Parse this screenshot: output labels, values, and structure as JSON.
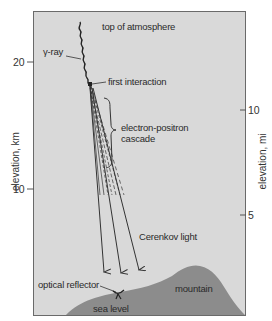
{
  "diagram": {
    "labels": {
      "top_of_atmosphere": "top of atmosphere",
      "gamma_ray": "γ-ray",
      "first_interaction": "first interaction",
      "cascade_line1": "electron-positron",
      "cascade_line2": "cascade",
      "cerenkov_light": "Cerenkov light",
      "optical_reflector": "optical reflector",
      "mountain": "mountain",
      "sea_level": "sea level"
    },
    "left_axis": {
      "title": "elevation, km",
      "ticks": [
        {
          "value": "20",
          "y": 62
        },
        {
          "value": "10",
          "y": 189
        }
      ]
    },
    "right_axis": {
      "title": "elevation, mi",
      "ticks": [
        {
          "value": "10",
          "y": 110
        },
        {
          "value": "5",
          "y": 215
        }
      ]
    },
    "colors": {
      "sky": "#d9d9d9",
      "ground": "#8c8c8c",
      "frame": "#6a6a6a",
      "lines": "#333333"
    }
  }
}
